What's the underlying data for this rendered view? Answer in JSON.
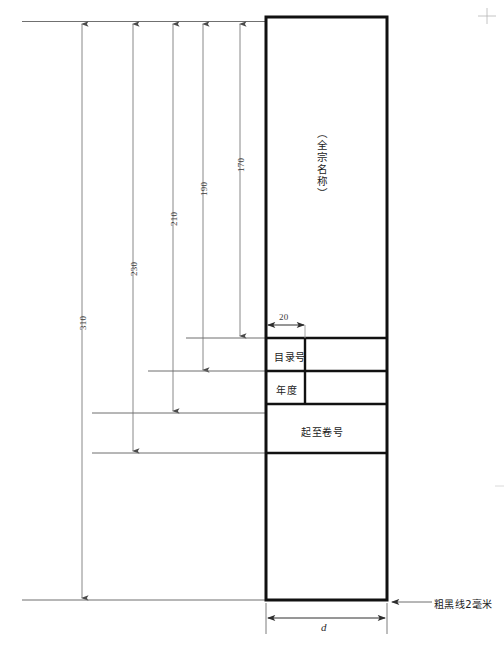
{
  "drawing": {
    "title_vertical": "（全宗名称）",
    "note": "粗黑线2毫米",
    "width_symbol": "d",
    "table_rows": [
      {
        "label": "目录号",
        "span": "half"
      },
      {
        "label": "年度",
        "span": "half"
      },
      {
        "label": "起至卷号",
        "span": "full"
      }
    ],
    "dimensions": {
      "vertical": [
        {
          "value": "310",
          "x": 82,
          "label_x": 75,
          "label_y": 330,
          "end_y": 600
        },
        {
          "value": "230",
          "x": 133,
          "label_x": 126,
          "label_y": 275,
          "end_y": 453
        },
        {
          "value": "210",
          "x": 173,
          "label_x": 166,
          "label_y": 225,
          "end_y": 413
        },
        {
          "value": "190",
          "x": 203,
          "label_x": 196,
          "label_y": 195,
          "end_y": 372
        },
        {
          "value": "170",
          "x": 240,
          "label_x": 233,
          "label_y": 170,
          "end_y": 338
        }
      ],
      "horizontal": [
        {
          "value": "20",
          "x1": 268,
          "x2": 305,
          "y": 325
        },
        {
          "value": "d",
          "x1": 268,
          "x2": 387,
          "y": 619
        }
      ]
    },
    "box": {
      "left": 266,
      "top": 17,
      "right": 387,
      "bottom": 600,
      "divider_x": 305,
      "row_lines_y": [
        338,
        371,
        404,
        453
      ],
      "stroke_width": 3,
      "stroke_color": "#111111"
    },
    "colors": {
      "ink": "#111111",
      "dim_line": "#6b6b6b",
      "background": "#ffffff"
    }
  }
}
